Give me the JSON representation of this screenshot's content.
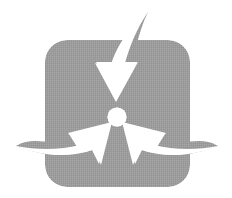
{
  "document": {
    "kind": "logo-image",
    "title": "Three-arrow convergence logo",
    "background_color": "#ffffff",
    "width": 232,
    "height": 198
  },
  "logo": {
    "name": "trefoil-arrows-logo",
    "alt_text": "Gray rounded square badge with three white curved arrows converging on a central white circle",
    "colors": {
      "badge_fill": "#9c9c9c",
      "arrow_fill": "#ffffff",
      "hub_fill": "#ffffff",
      "canvas": "#ffffff"
    },
    "badge": {
      "name": "rounded-square-badge",
      "x": 45,
      "y": 40,
      "width": 145,
      "height": 147,
      "corner_radius": 22,
      "fill": "#9c9c9c"
    },
    "hub": {
      "name": "center-circle",
      "cx": 117,
      "cy": 117,
      "r": 9.5,
      "fill": "#ffffff"
    },
    "arrows": [
      {
        "name": "arrow-top-down",
        "label": "top arrow pointing down",
        "direction": "down",
        "tail_tip": [
          148,
          12
        ],
        "head_tip": [
          117,
          102
        ],
        "fill": "#ffffff"
      },
      {
        "name": "arrow-bottom-left-up-right",
        "label": "lower-left arrow pointing up-right",
        "direction": "up-right",
        "tail_tip": [
          16,
          146
        ],
        "head_tip": [
          104,
          125
        ],
        "fill": "#ffffff"
      },
      {
        "name": "arrow-bottom-right-up-left",
        "label": "lower-right arrow pointing up-left",
        "direction": "up-left",
        "tail_tip": [
          218,
          146
        ],
        "head_tip": [
          130,
          125
        ],
        "fill": "#ffffff"
      }
    ]
  }
}
